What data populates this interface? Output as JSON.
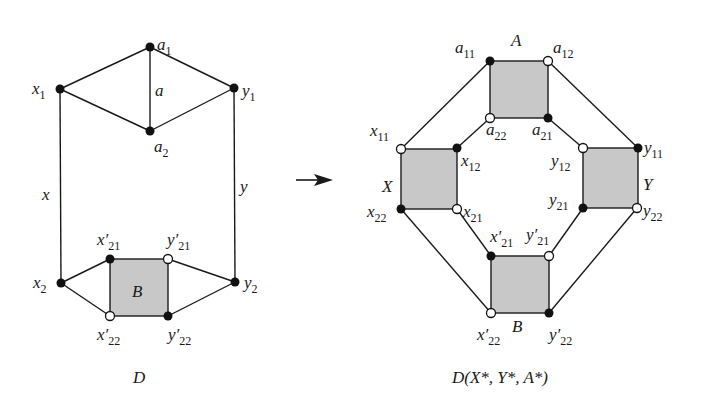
{
  "left_graph": {
    "caption": "D",
    "edge_labels": {
      "a": "a",
      "x": "x",
      "y": "y"
    },
    "face_label": "B",
    "vertices": {
      "a1": {
        "base": "a",
        "sub": "1",
        "prime": ""
      },
      "a2": {
        "base": "a",
        "sub": "2",
        "prime": ""
      },
      "x1": {
        "base": "x",
        "sub": "1",
        "prime": ""
      },
      "y1": {
        "base": "y",
        "sub": "1",
        "prime": ""
      },
      "x2": {
        "base": "x",
        "sub": "2",
        "prime": ""
      },
      "y2": {
        "base": "y",
        "sub": "2",
        "prime": ""
      },
      "xp21": {
        "base": "x",
        "sub": "21",
        "prime": "′"
      },
      "yp21": {
        "base": "y",
        "sub": "21",
        "prime": "′"
      },
      "xp22": {
        "base": "x",
        "sub": "22",
        "prime": "′"
      },
      "yp22": {
        "base": "y",
        "sub": "22",
        "prime": "′"
      }
    }
  },
  "arrow": {
    "direction": "right"
  },
  "right_graph": {
    "caption": "D(X*, Y*, A*)",
    "face_labels": {
      "A": "A",
      "X": "X",
      "Y": "Y",
      "B": "B"
    },
    "vertices": {
      "a11": {
        "base": "a",
        "sub": "11",
        "prime": ""
      },
      "a12": {
        "base": "a",
        "sub": "12",
        "prime": ""
      },
      "a22": {
        "base": "a",
        "sub": "22",
        "prime": ""
      },
      "a21": {
        "base": "a",
        "sub": "21",
        "prime": ""
      },
      "x11": {
        "base": "x",
        "sub": "11",
        "prime": ""
      },
      "x12": {
        "base": "x",
        "sub": "12",
        "prime": ""
      },
      "x22": {
        "base": "x",
        "sub": "22",
        "prime": ""
      },
      "x21": {
        "base": "x",
        "sub": "21",
        "prime": ""
      },
      "y12": {
        "base": "y",
        "sub": "12",
        "prime": ""
      },
      "y11": {
        "base": "y",
        "sub": "11",
        "prime": ""
      },
      "y21": {
        "base": "y",
        "sub": "21",
        "prime": ""
      },
      "y22": {
        "base": "y",
        "sub": "22",
        "prime": ""
      },
      "xp21": {
        "base": "x",
        "sub": "21",
        "prime": "′"
      },
      "yp21": {
        "base": "y",
        "sub": "21",
        "prime": "′"
      },
      "xp22": {
        "base": "x",
        "sub": "22",
        "prime": "′"
      },
      "yp22": {
        "base": "y",
        "sub": "22",
        "prime": "′"
      }
    }
  }
}
